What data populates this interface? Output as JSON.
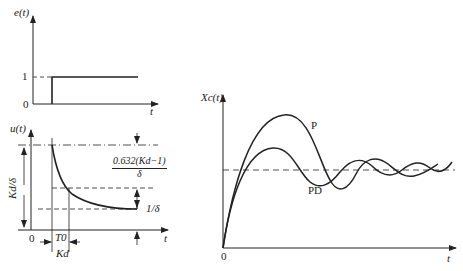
{
  "figure": {
    "panel_error": {
      "y_label": "e(t)",
      "x_label": "t",
      "ticks": {
        "one": "1",
        "zero": "0"
      }
    },
    "panel_control": {
      "y_label": "u(t)",
      "x_label": "t",
      "origin": "0",
      "left_dimension": "Kd/δ",
      "time_constant": "T0",
      "kd_label": "Kd",
      "decay_fraction_numerator": "0.632(Kd−1)",
      "decay_fraction_denominator": "δ",
      "steady_label": "1/δ"
    },
    "panel_response": {
      "y_label": "Xc(t)",
      "x_label": "t",
      "origin": "0",
      "curves": [
        {
          "name": "P",
          "label": "P"
        },
        {
          "name": "PD",
          "label": "PD"
        }
      ]
    }
  },
  "colors": {
    "stroke": "#222222",
    "background": "#ffffff"
  }
}
